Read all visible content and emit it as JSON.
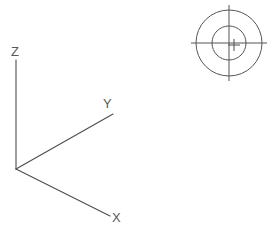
{
  "drawing": {
    "title": "3D Coordinate Axis Triad with Datum Target Symbol",
    "background_color": "#ffffff",
    "line_color": "#4d4d4d",
    "label_color": "#595959",
    "width": 277,
    "height": 233
  },
  "axes": {
    "origin": {
      "x": 16,
      "y": 169
    },
    "items": [
      {
        "id": "z",
        "label": "Z",
        "direction": "up",
        "end": {
          "x": 16,
          "y": 60
        },
        "label_pos": {
          "x": 11,
          "y": 56
        }
      },
      {
        "id": "y",
        "label": "Y",
        "direction": "up-right",
        "end": {
          "x": 113,
          "y": 114
        },
        "label_pos": {
          "x": 103,
          "y": 108
        }
      },
      {
        "id": "x",
        "label": "X",
        "direction": "down-right",
        "end": {
          "x": 110,
          "y": 216
        },
        "label_pos": {
          "x": 112,
          "y": 222
        }
      }
    ]
  },
  "target_symbol": {
    "name": "datum-target-symbol",
    "center": {
      "x": 229,
      "y": 43
    },
    "outer_radius": 33,
    "inner_radius": 17,
    "crosshair_overhang": 5,
    "center_mark": {
      "x": 234,
      "y": 45,
      "arm_length": 6
    }
  }
}
